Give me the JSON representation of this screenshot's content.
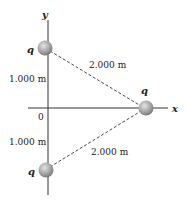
{
  "diagram": {
    "axes": {
      "x_label": "x",
      "y_label": "y",
      "origin_label": "0"
    },
    "charges": [
      {
        "label": "q",
        "position": "top",
        "x": 0,
        "y": 1.0
      },
      {
        "label": "q",
        "position": "right",
        "x": 1.732,
        "y": 0
      },
      {
        "label": "q",
        "position": "bottom",
        "x": 0,
        "y": -1.0
      }
    ],
    "distances": {
      "top_to_origin": "1.000 m",
      "bottom_to_origin": "1.000 m",
      "top_to_right": "2.000 m",
      "bottom_to_right": "2.000 m"
    },
    "colors": {
      "sphere": "#a8a8a8",
      "axis": "#333333",
      "dash": "#333333"
    }
  }
}
